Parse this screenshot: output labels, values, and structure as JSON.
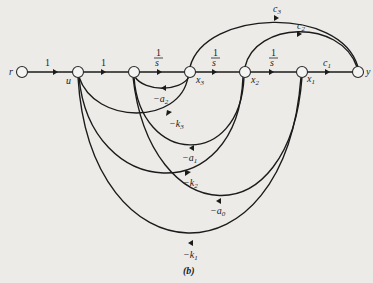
{
  "diagram": {
    "type": "signal-flow-graph",
    "caption": "(b)",
    "nodes": [
      {
        "id": "r",
        "label": "r"
      },
      {
        "id": "u",
        "label": "u"
      },
      {
        "id": "n3",
        "label": ""
      },
      {
        "id": "x3",
        "label": "x",
        "sub": "3"
      },
      {
        "id": "x2",
        "label": "x",
        "sub": "2"
      },
      {
        "id": "x1",
        "label": "x",
        "sub": "1"
      },
      {
        "id": "y",
        "label": "y"
      }
    ],
    "forward_gains": {
      "r_u": "1",
      "u_n3": "1",
      "n3_x3_num": "1",
      "n3_x3_den": "s",
      "x3_x2_num": "1",
      "x3_x2_den": "s",
      "x2_x1_num": "1",
      "x2_x1_den": "s",
      "x1_y": "c",
      "x1_y_sub": "1"
    },
    "feedforward": {
      "c3": {
        "label": "c",
        "sub": "3",
        "from": "x3",
        "to": "y"
      },
      "c2": {
        "label": "c",
        "sub": "2",
        "from": "x2",
        "to": "y"
      }
    },
    "feedback": {
      "a2": {
        "label": "−a",
        "sub": "2",
        "from": "x3",
        "to": "n3"
      },
      "k3": {
        "label": "−k",
        "sub": "3",
        "from": "x3",
        "to": "u"
      },
      "a1": {
        "label": "−a",
        "sub": "1",
        "from": "x2",
        "to": "n3"
      },
      "k2": {
        "label": "−k",
        "sub": "2",
        "from": "x2",
        "to": "u"
      },
      "a0": {
        "label": "−a",
        "sub": "0",
        "from": "x1",
        "to": "n3"
      },
      "k1": {
        "label": "−k",
        "sub": "1",
        "from": "x1",
        "to": "u"
      }
    }
  }
}
